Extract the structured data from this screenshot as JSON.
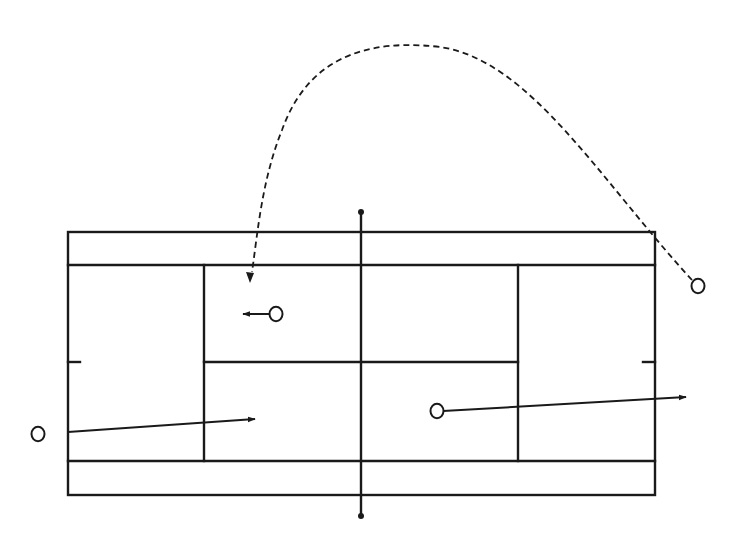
{
  "diagram": {
    "title": "Tennis court shot diagram",
    "colors": {
      "line": "#1a1a1a",
      "background": "#ffffff",
      "player_fill": "#ffffff"
    },
    "court": {
      "outer": {
        "x1": 68,
        "y1": 232,
        "x2": 655,
        "y2": 495
      },
      "singles_top_y": 265,
      "singles_bottom_y": 461,
      "service_line_left_x": 204,
      "service_line_right_x": 518,
      "center_service_y": 362,
      "center_mark_length": 12
    },
    "net": {
      "x": 361,
      "top_y": 212,
      "bottom_y": 516,
      "post_radius": 3
    },
    "players": [
      {
        "id": "player-left-outside",
        "x": 38,
        "y": 434,
        "r": 6.5
      },
      {
        "id": "player-top-left-service-box",
        "x": 276,
        "y": 314,
        "r": 6.5
      },
      {
        "id": "player-bottom-right-service-box",
        "x": 437,
        "y": 411,
        "r": 6.5
      },
      {
        "id": "player-right-outside",
        "x": 698,
        "y": 286,
        "r": 6.5
      }
    ],
    "shots": [
      {
        "id": "shot-left-drive",
        "type": "solid",
        "from": [
          68,
          432
        ],
        "to": [
          255,
          419
        ]
      },
      {
        "id": "shot-short-move",
        "type": "solid",
        "from": [
          270,
          314
        ],
        "to": [
          243,
          314
        ]
      },
      {
        "id": "shot-right-drive",
        "type": "solid",
        "from": [
          443,
          411
        ],
        "to": [
          686,
          397
        ]
      },
      {
        "id": "shot-lob",
        "type": "dashed",
        "path": "M 692 280 C 600 180, 530 60, 440 47 C 340 35, 300 80, 282 130 C 262 180, 258 230, 252 272",
        "arrow_tip": [
          250,
          283
        ]
      }
    ]
  }
}
